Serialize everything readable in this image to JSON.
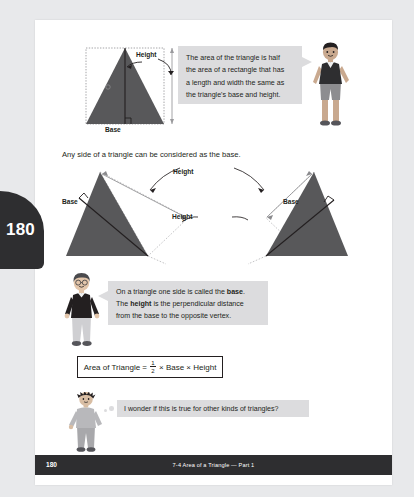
{
  "page": {
    "number": "180",
    "tab_number": "180",
    "footer_title": "7-4 Area of a Triangle — Part 1",
    "background_color": "#e8e9eb",
    "sheet_color": "#ffffff",
    "accent_dark": "#2e2e30",
    "shape_fill": "#58585a",
    "bubble_fill": "#dcdcde"
  },
  "top_diagram": {
    "height_label": "Height",
    "base_label": "Base"
  },
  "bubble_area": {
    "lines": [
      "The area of the triangle is half",
      "the area of a rectangle that has",
      "a length and width the same as",
      "the triangle's base and height."
    ]
  },
  "sentence_anyside": "Any side of a triangle can be considered as the base.",
  "middle_diagram": {
    "height_label_top": "Height",
    "height_label_bottom": "Height",
    "base_label_left": "Base",
    "base_label_right": "Base"
  },
  "bubble_definition": {
    "line1_pre": "On a triangle one side is called the ",
    "line1_bold": "base",
    "line1_post": ".",
    "line2_pre": "The ",
    "line2_bold": "height",
    "line2_post": " is the perpendicular distance",
    "line3": "from the base to the opposite vertex."
  },
  "formula": {
    "lead": "Area of Triangle =",
    "numerator": "1",
    "denominator": "2",
    "tail": "× Base × Height"
  },
  "bubble_wonder": {
    "text": "I wonder if this is true for other kinds of triangles?"
  },
  "characters": {
    "boy_top": "boy-character-pointing",
    "girl_middle": "child-character-sweater",
    "boy_bottom": "boy-character-thinking"
  }
}
